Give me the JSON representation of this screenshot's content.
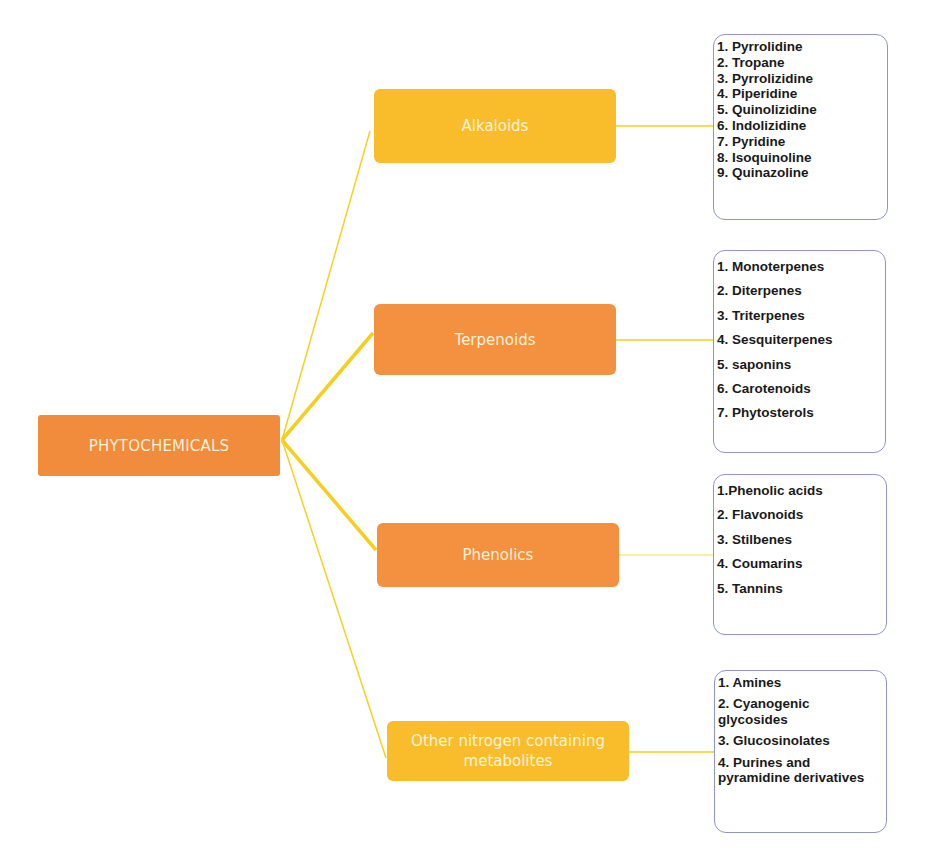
{
  "diagram": {
    "root": {
      "label": "PHYTOCHEMICALS",
      "color": "#f08c3c"
    },
    "categories": [
      {
        "label": "Alkaloids",
        "color": "#f9bd2c",
        "items": [
          "1. Pyrrolidine",
          "2. Tropane",
          "3. Pyrrolizidine",
          "4. Piperidine",
          "5. Quinolizidine",
          "6. Indolizidine",
          "7. Pyridine",
          "8. Isoquinoline",
          "9. Quinazoline"
        ]
      },
      {
        "label": "Terpenoids",
        "color": "#f39140",
        "items": [
          "1. Monoterpenes",
          "2. Diterpenes",
          "3. Triterpenes",
          "4. Sesquiterpenes",
          "5. saponins",
          "6. Carotenoids",
          "7. Phytosterols"
        ]
      },
      {
        "label": "Phenolics",
        "color": "#f39140",
        "items": [
          "1.Phenolic acids",
          "2. Flavonoids",
          "3. Stilbenes",
          "4. Coumarins",
          "5. Tannins"
        ]
      },
      {
        "label": "Other nitrogen containing metabolites",
        "color": "#f9bd2c",
        "items": [
          "1. Amines",
          "2. Cyanogenic glycosides",
          "3. Glucosinolates",
          "4. Purines and pyramidine derivatives"
        ]
      }
    ],
    "connector_color": "#f5d21e",
    "item_box_border_color": "#8d96c4"
  }
}
